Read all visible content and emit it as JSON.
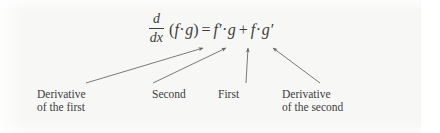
{
  "figure": {
    "kind": "math-formula-annotated-diagram",
    "background_color": "#f7f7f5",
    "text_color": "#3d3d3d",
    "arrow_color": "#6b6b6b"
  },
  "formula": {
    "full_text": "d/dx (f·g) = f'·g + f·g'",
    "fraction": {
      "numerator": "d",
      "denominator": "dx"
    },
    "open_paren": "(",
    "lhs_f": "f",
    "lhs_dot": "·",
    "lhs_g": "g",
    "close_paren": ")",
    "equals": "=",
    "t1_f": "f",
    "t1_prime": "′",
    "t1_dot": "·",
    "t1_g": "g",
    "plus": "+",
    "t2_f": "f",
    "t2_dot": "·",
    "t2_g": "g",
    "t2_prime": "′"
  },
  "annotations": [
    {
      "id": "derivative-of-the-first",
      "line1": "Derivative",
      "line2": "of the first",
      "points_to": "f′ (derivative of first factor)"
    },
    {
      "id": "second",
      "line1": "Second",
      "line2": "",
      "points_to": "g (second factor)"
    },
    {
      "id": "first",
      "line1": "First",
      "line2": "",
      "points_to": "f (first factor)"
    },
    {
      "id": "derivative-of-the-second",
      "line1": "Derivative",
      "line2": "of the second",
      "points_to": "g′ (derivative of second factor)"
    }
  ]
}
